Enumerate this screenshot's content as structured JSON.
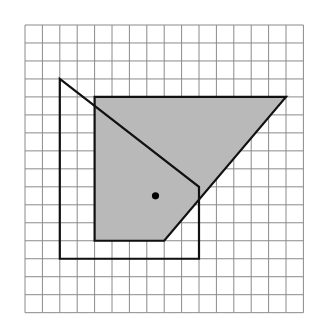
{
  "diagram": {
    "grid": {
      "columns": 16,
      "rows": 16,
      "origin_px": [
        25,
        25
      ],
      "cell_width_px": 17.4,
      "cell_height_px": 17.98,
      "line_color": "#8a8a8a"
    },
    "shaded_shape": {
      "vertices": [
        [
          4,
          4
        ],
        [
          15,
          4
        ],
        [
          8,
          12
        ],
        [
          4,
          12
        ]
      ],
      "fill": "#b9b9b9",
      "stroke": "#111111"
    },
    "outline_shape": {
      "vertices": [
        [
          2,
          3
        ],
        [
          10,
          9
        ],
        [
          10,
          13
        ],
        [
          2,
          13
        ]
      ],
      "stroke": "#111111"
    },
    "point": {
      "position": [
        7.5,
        9.5
      ],
      "color": "#000000",
      "radius_px": 3.6
    }
  }
}
